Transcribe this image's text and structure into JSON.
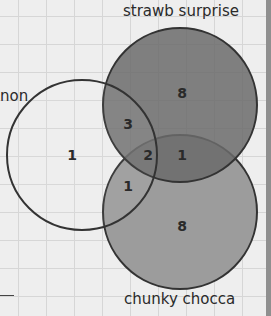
{
  "diagram": {
    "type": "venn",
    "sets": [
      {
        "name": "lemon",
        "visible_label": "non",
        "fill": "none"
      },
      {
        "name": "strawb surprise",
        "visible_label": "strawb surprise",
        "fill": "#6a6a6a"
      },
      {
        "name": "chunky chocca",
        "visible_label": "chunky chocca",
        "fill": "#9c9c9c"
      }
    ],
    "regions": {
      "lemon_only": "1",
      "strawb_only": "8",
      "chocca_only": "8",
      "lemon_strawb": "3",
      "lemon_chocca": "1",
      "strawb_chocca": "1",
      "all_three": "2"
    }
  }
}
